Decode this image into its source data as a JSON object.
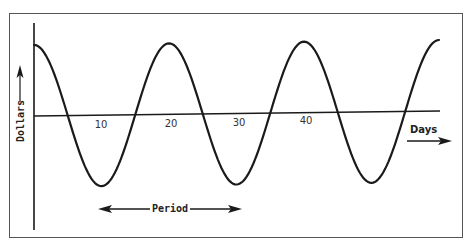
{
  "chart_data": {
    "type": "line",
    "title": "",
    "xlabel": "Days",
    "ylabel": "Dollars",
    "annotation": "Period",
    "x_ticks": [
      10,
      20,
      30,
      40
    ],
    "x_tick_labels": [
      "10",
      "20",
      "30",
      "40"
    ],
    "xlim": [
      0,
      60
    ],
    "ylim": [
      -1.2,
      1.2
    ],
    "grid": false,
    "legend": null,
    "series": [
      {
        "name": "cycle",
        "description": "Cosine-like periodic wave with period of 20 days, peaking at day 0, 20, 40, 60 and troughing at day 10, 30, 50",
        "x": [
          0,
          5,
          10,
          15,
          20,
          25,
          30,
          35,
          40,
          45,
          50,
          55,
          60
        ],
        "values": [
          1,
          0,
          -1,
          0,
          1,
          0,
          -1,
          0,
          1,
          0,
          -1,
          0,
          1
        ]
      }
    ],
    "period_days": 20,
    "period_arrow_span_days": [
      10,
      30
    ]
  },
  "labels": {
    "y_axis": "Dollars",
    "x_axis": "Days",
    "period": "Period",
    "ticks": [
      "10",
      "20",
      "30",
      "40"
    ]
  },
  "colors": {
    "line": "#1a1a1a",
    "frame": "#444444",
    "background": "#ffffff"
  }
}
